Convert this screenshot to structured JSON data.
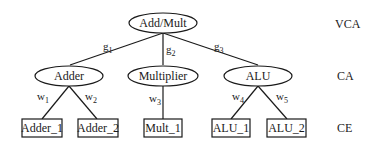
{
  "diagram": {
    "root": {
      "label": "Add/Mult",
      "shape": "ellipse"
    },
    "categories": [
      {
        "label": "Adder",
        "shape": "ellipse",
        "edge_label": "g",
        "edge_sub": "1"
      },
      {
        "label": "Multiplier",
        "shape": "ellipse",
        "edge_label": "g",
        "edge_sub": "2"
      },
      {
        "label": "ALU",
        "shape": "ellipse",
        "edge_label": "g",
        "edge_sub": "3"
      }
    ],
    "elements": [
      {
        "label": "Adder_1",
        "parent": "Adder",
        "shape": "box",
        "edge_label": "w",
        "edge_sub": "1"
      },
      {
        "label": "Adder_2",
        "parent": "Adder",
        "shape": "box",
        "edge_label": "w",
        "edge_sub": "2"
      },
      {
        "label": "Mult_1",
        "parent": "Multiplier",
        "shape": "box",
        "edge_label": "w",
        "edge_sub": "3"
      },
      {
        "label": "ALU_1",
        "parent": "ALU",
        "shape": "box",
        "edge_label": "w",
        "edge_sub": "4"
      },
      {
        "label": "ALU_2",
        "parent": "ALU",
        "shape": "box",
        "edge_label": "w",
        "edge_sub": "5"
      }
    ],
    "levels": [
      {
        "label": "VCA"
      },
      {
        "label": "CA"
      },
      {
        "label": "CE"
      }
    ]
  }
}
